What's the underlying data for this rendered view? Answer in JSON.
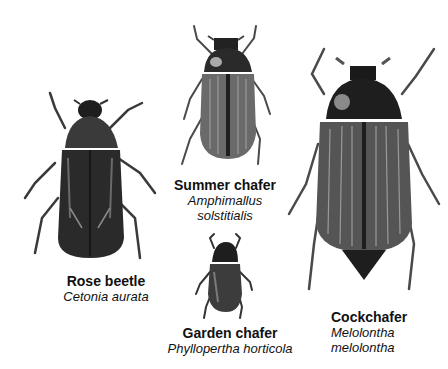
{
  "figure": {
    "beetles": [
      {
        "id": "rose-beetle",
        "common_name": "Rose beetle",
        "scientific_name": "Cetonia aurata"
      },
      {
        "id": "summer-chafer",
        "common_name": "Summer chafer",
        "scientific_name_line1": "Amphimallus",
        "scientific_name_line2": "solstitialis"
      },
      {
        "id": "garden-chafer",
        "common_name": "Garden chafer",
        "scientific_name": "Phyllopertha horticola"
      },
      {
        "id": "cockchafer",
        "common_name": "Cockchafer",
        "scientific_name_line1": "Melolontha",
        "scientific_name_line2": "melolontha"
      }
    ],
    "colors": {
      "background": "#ffffff",
      "beetle_dark": "#1e1e1e",
      "beetle_mid": "#555555",
      "beetle_light": "#9a9a9a"
    }
  }
}
